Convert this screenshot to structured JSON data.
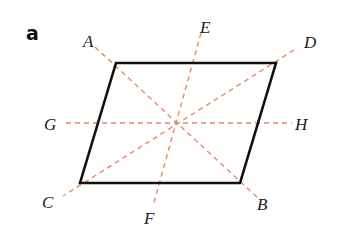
{
  "panel_label": "a",
  "colors": {
    "shape_stroke": "#111111",
    "axis_stroke": "#e8896a",
    "label": "#1a1a1a"
  },
  "parallelogram": {
    "vertices": [
      [
        116,
        63
      ],
      [
        276,
        63
      ],
      [
        240,
        183
      ],
      [
        80,
        183
      ]
    ]
  },
  "lines": [
    {
      "name": "line-AB",
      "from": "A",
      "to": "B",
      "x1": 95,
      "y1": 47,
      "x2": 258,
      "y2": 198
    },
    {
      "name": "line-DC",
      "from": "D",
      "to": "C",
      "x1": 294,
      "y1": 50,
      "x2": 63,
      "y2": 196
    },
    {
      "name": "line-EF",
      "from": "E",
      "to": "F",
      "x1": 201,
      "y1": 33,
      "x2": 153,
      "y2": 206
    },
    {
      "name": "line-GH",
      "from": "G",
      "to": "H",
      "x1": 66,
      "y1": 123,
      "x2": 292,
      "y2": 123
    }
  ],
  "labels": [
    {
      "text": "A",
      "x": 83,
      "y": 47
    },
    {
      "text": "E",
      "x": 200,
      "y": 33
    },
    {
      "text": "D",
      "x": 304,
      "y": 48
    },
    {
      "text": "G",
      "x": 44,
      "y": 130
    },
    {
      "text": "H",
      "x": 295,
      "y": 130
    },
    {
      "text": "C",
      "x": 42,
      "y": 208
    },
    {
      "text": "F",
      "x": 144,
      "y": 224
    },
    {
      "text": "B",
      "x": 257,
      "y": 210
    }
  ]
}
